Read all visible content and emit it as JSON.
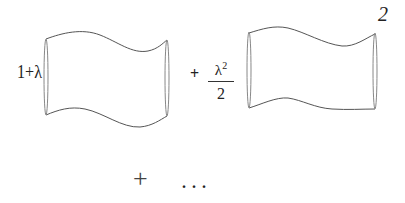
{
  "diagram": {
    "type": "string-diagram-series",
    "terms": [
      {
        "coefficient": "1+λ",
        "shape": "tube",
        "label": ""
      },
      {
        "operator": "+",
        "coefficient_numerator": "λ",
        "coefficient_exponent": "2",
        "coefficient_denominator": "2",
        "shape": "tube",
        "label": "2"
      }
    ],
    "continuation": {
      "operator": "+",
      "ellipsis": "..."
    },
    "colors": {
      "stroke": "#555555",
      "background": "#ffffff",
      "text": "#222222"
    }
  }
}
